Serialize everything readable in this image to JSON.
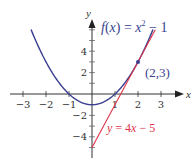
{
  "chart_data": {
    "type": "line",
    "title": "",
    "xlabel": "x",
    "ylabel": "y",
    "xlim": [
      -3.4,
      3.7
    ],
    "ylim": [
      -5.5,
      7
    ],
    "x_ticks": [
      -3,
      -2,
      -1,
      1,
      2,
      3
    ],
    "y_ticks": [
      -4,
      -2,
      2,
      4
    ],
    "x_tick_labels": [
      "−3",
      "−2",
      "−1",
      "1",
      "2",
      "3"
    ],
    "y_tick_labels": [
      "−4",
      "−2",
      "2",
      "4"
    ],
    "grid": false,
    "series": [
      {
        "name": "f(x) = x² − 1",
        "kind": "curve",
        "color": "#3a3f8f",
        "x_range": [
          -2.65,
          2.65
        ],
        "x": [
          -2.65,
          -2,
          -1,
          0,
          1,
          2,
          2.65
        ],
        "y": [
          6.02,
          3,
          0,
          -1,
          0,
          3,
          6.02
        ]
      },
      {
        "name": "y = 4x − 5",
        "kind": "line",
        "color": "#e0344a",
        "x_range": [
          0,
          2.75
        ],
        "x": [
          0,
          1.25,
          2,
          2.75
        ],
        "y": [
          -5,
          0,
          3,
          6
        ]
      }
    ],
    "annotations": [
      {
        "text": "(2,3)",
        "x": 2,
        "y": 3,
        "marker": "point",
        "color": "#3a3f8f"
      }
    ]
  },
  "labels": {
    "function": {
      "f": "f",
      "open": "(",
      "x": "x",
      "close": ")",
      "eq": " = ",
      "xsq": "x",
      "exp": "2",
      "rest": " − 1"
    },
    "point": "(2,3)",
    "tangent": {
      "y": "y",
      "eq": " = 4",
      "x": "x",
      "rest": " − 5"
    },
    "x_axis": "x",
    "y_axis": "y"
  },
  "colors": {
    "curve": "#3a3f8f",
    "tangent": "#e0344a",
    "axis": "#333333"
  }
}
